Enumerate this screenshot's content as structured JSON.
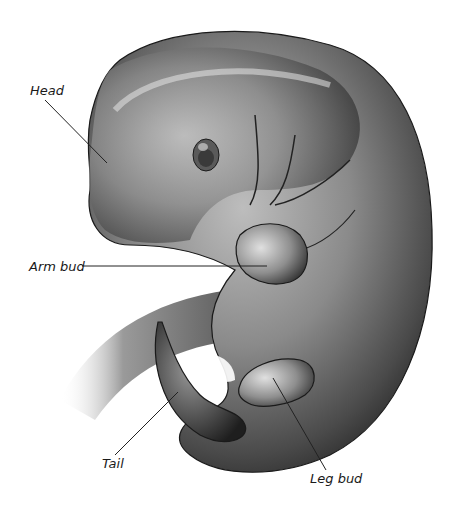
{
  "figure": {
    "background": "#ffffff",
    "line_color": "#222222",
    "labels": [
      {
        "id": "head",
        "text": "Head",
        "x": 30,
        "y": 84,
        "line": [
          45,
          100,
          107,
          163
        ]
      },
      {
        "id": "arm-bud",
        "text": "Arm bud",
        "x": 29,
        "y": 260,
        "line": [
          82,
          266,
          267,
          266
        ]
      },
      {
        "id": "tail",
        "text": "Tail",
        "x": 102,
        "y": 457,
        "line": [
          115,
          455,
          178,
          392
        ]
      },
      {
        "id": "leg-bud",
        "text": "Leg bud",
        "x": 310,
        "y": 472,
        "line": [
          326,
          470,
          273,
          378
        ]
      }
    ]
  }
}
